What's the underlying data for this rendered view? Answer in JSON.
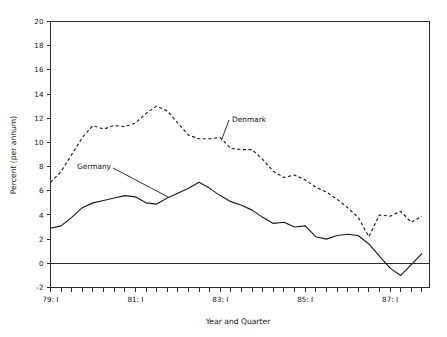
{
  "chart_data": {
    "type": "line",
    "title": "",
    "xlabel": "Year and Quarter",
    "ylabel": "Percent (per annum)",
    "ylim": [
      -2,
      20
    ],
    "ytick_labels": [
      "20",
      "18",
      "16",
      "14",
      "12",
      "10",
      "8",
      "6",
      "4",
      "2",
      "0",
      "-2"
    ],
    "ytick_values": [
      20,
      18,
      16,
      14,
      12,
      10,
      8,
      6,
      4,
      2,
      0,
      -2
    ],
    "xtick_labels": [
      "79: I",
      "81: I",
      "83: I",
      "85: I",
      "87: I"
    ],
    "xtick_values": [
      "1979Q1",
      "1981Q1",
      "1983Q1",
      "1985Q1",
      "1987Q1"
    ],
    "x_minor_tick_interval": "quarter",
    "grid": false,
    "legend_position": "inline-annotations",
    "annotations": [
      {
        "text": "Denmark",
        "series": "Denmark"
      },
      {
        "text": "Germany",
        "series": "Germany"
      }
    ],
    "x": [
      "1979Q1",
      "1979Q2",
      "1979Q3",
      "1979Q4",
      "1980Q1",
      "1980Q2",
      "1980Q3",
      "1980Q4",
      "1981Q1",
      "1981Q2",
      "1981Q3",
      "1981Q4",
      "1982Q1",
      "1982Q2",
      "1982Q3",
      "1982Q4",
      "1983Q1",
      "1983Q2",
      "1983Q3",
      "1983Q4",
      "1984Q1",
      "1984Q2",
      "1984Q3",
      "1984Q4",
      "1985Q1",
      "1985Q2",
      "1985Q3",
      "1985Q4",
      "1986Q1",
      "1986Q2",
      "1986Q3",
      "1986Q4",
      "1987Q1",
      "1987Q2",
      "1987Q3",
      "1987Q4"
    ],
    "series": [
      {
        "name": "Denmark",
        "style": "dashed",
        "color": "#1a1a1a",
        "values": [
          6.7,
          7.6,
          9.0,
          10.4,
          11.4,
          11.1,
          11.4,
          11.3,
          11.6,
          12.4,
          13.0,
          12.6,
          11.6,
          10.6,
          10.3,
          10.3,
          10.4,
          9.5,
          9.4,
          9.4,
          8.6,
          7.6,
          7.1,
          7.3,
          6.9,
          6.3,
          5.9,
          5.3,
          4.6,
          3.8,
          2.2,
          4.0,
          3.9,
          4.3,
          3.4,
          3.9
        ]
      },
      {
        "name": "Germany",
        "style": "solid",
        "color": "#1a1a1a",
        "values": [
          2.9,
          3.1,
          3.8,
          4.6,
          5.0,
          5.2,
          5.4,
          5.6,
          5.5,
          5.0,
          4.9,
          5.4,
          5.8,
          6.2,
          6.7,
          6.2,
          5.6,
          5.1,
          4.8,
          4.4,
          3.8,
          3.3,
          3.4,
          3.0,
          3.1,
          2.2,
          2.0,
          2.3,
          2.4,
          2.3,
          1.6,
          0.6,
          -0.4,
          -1.0,
          -0.1,
          0.8
        ]
      }
    ]
  },
  "axes": {
    "y_axis_title": "Percent (per annum)",
    "x_axis_title": "Year and Quarter"
  },
  "labels": {
    "denmark": "Denmark",
    "germany": "Germany"
  }
}
